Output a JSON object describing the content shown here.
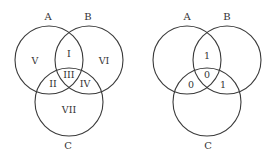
{
  "diagrams": [
    {
      "name": "region-numbering",
      "sets": {
        "a": "A",
        "b": "B",
        "c": "C"
      },
      "regions": {
        "a_and_b_only": "I",
        "a_and_c_only": "II",
        "a_b_c": "III",
        "b_and_c_only": "IV",
        "a_only": "V",
        "b_only": "VI",
        "c_only": "VII"
      }
    },
    {
      "name": "region-values",
      "sets": {
        "a": "A",
        "b": "B",
        "c": "C"
      },
      "regions": {
        "a_and_b_only": "1",
        "a_and_c_only": "0",
        "a_b_c": "0",
        "b_and_c_only": "1"
      }
    }
  ],
  "colors": {
    "stroke": "#3a3a3a",
    "text": "#333333",
    "background": "#ffffff"
  }
}
